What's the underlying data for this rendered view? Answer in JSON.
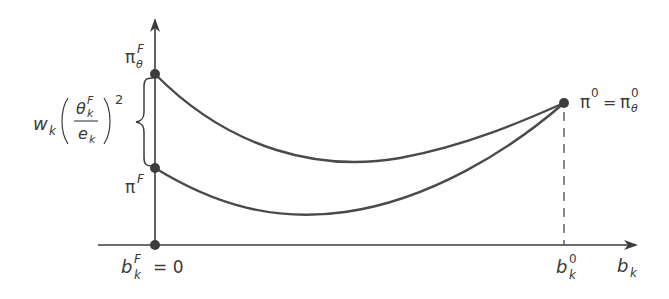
{
  "diagram": {
    "labels": {
      "pi_theta_F": {
        "base": "π",
        "sup": "F",
        "sub": "θ"
      },
      "pi_F": {
        "base": "π",
        "sup": "F"
      },
      "pi0_eq": {
        "left_base": "π",
        "left_sup": "0",
        "eq": "=",
        "right_base": "π",
        "right_sup": "0",
        "right_sub": "θ"
      },
      "bkF_zero": {
        "base": "b",
        "sup": "F",
        "sub": "k",
        "eq": "= 0"
      },
      "bk0": {
        "base": "b",
        "sup": "0",
        "sub": "k"
      },
      "bk_axis": {
        "base": "b",
        "sub": "k"
      },
      "bracket_expr": {
        "w": "w",
        "w_sub": "k",
        "num": "θ",
        "num_sup": "F",
        "num_sub": "k",
        "den": "e",
        "den_sub": "k",
        "power": "2"
      }
    },
    "colors": {
      "line": "#3c3c3c",
      "curve": "#4a4a4a",
      "text": "#3a3a3a"
    },
    "points": {
      "upper_left": [
        155,
        74
      ],
      "lower_left": [
        155,
        168
      ],
      "origin": [
        155,
        245
      ],
      "right": [
        564,
        103
      ]
    }
  }
}
